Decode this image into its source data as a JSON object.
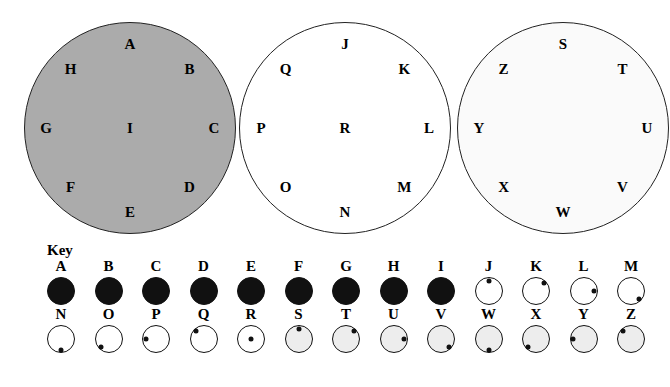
{
  "diagram": {
    "circles": [
      {
        "name": "circle-one",
        "fill": "#ababab",
        "stroke": "#222222",
        "center_label": "I",
        "ring_labels": [
          "A",
          "B",
          "C",
          "D",
          "E",
          "F",
          "G",
          "H"
        ]
      },
      {
        "name": "circle-two",
        "fill": "#ffffff",
        "stroke": "#222222",
        "center_label": "R",
        "ring_labels": [
          "J",
          "K",
          "L",
          "M",
          "N",
          "O",
          "P",
          "Q"
        ]
      },
      {
        "name": "circle-three",
        "fill": "#fafafa",
        "stroke": "#222222",
        "center_label": "",
        "ring_labels": [
          "S",
          "T",
          "U",
          "V",
          "W",
          "X",
          "Y",
          "Z"
        ]
      }
    ]
  },
  "key": {
    "title": "Key",
    "columns": [
      {
        "top": {
          "letter": "A",
          "fill": "dark",
          "dot": "none"
        },
        "bottom": {
          "letter": "N",
          "fill": "white",
          "dot": "bottom"
        }
      },
      {
        "top": {
          "letter": "B",
          "fill": "dark",
          "dot": "none"
        },
        "bottom": {
          "letter": "O",
          "fill": "white",
          "dot": "bottom-left"
        }
      },
      {
        "top": {
          "letter": "C",
          "fill": "dark",
          "dot": "none"
        },
        "bottom": {
          "letter": "P",
          "fill": "white",
          "dot": "left"
        }
      },
      {
        "top": {
          "letter": "D",
          "fill": "dark",
          "dot": "none"
        },
        "bottom": {
          "letter": "Q",
          "fill": "white",
          "dot": "top-left"
        }
      },
      {
        "top": {
          "letter": "E",
          "fill": "dark",
          "dot": "none"
        },
        "bottom": {
          "letter": "R",
          "fill": "white",
          "dot": "center"
        }
      },
      {
        "top": {
          "letter": "F",
          "fill": "dark",
          "dot": "none"
        },
        "bottom": {
          "letter": "S",
          "fill": "light",
          "dot": "top"
        }
      },
      {
        "top": {
          "letter": "G",
          "fill": "dark",
          "dot": "none"
        },
        "bottom": {
          "letter": "T",
          "fill": "light",
          "dot": "top-right"
        }
      },
      {
        "top": {
          "letter": "H",
          "fill": "dark",
          "dot": "none"
        },
        "bottom": {
          "letter": "U",
          "fill": "light",
          "dot": "right"
        }
      },
      {
        "top": {
          "letter": "I",
          "fill": "dark",
          "dot": "none"
        },
        "bottom": {
          "letter": "V",
          "fill": "light",
          "dot": "bottom-right"
        }
      },
      {
        "top": {
          "letter": "J",
          "fill": "white",
          "dot": "top"
        },
        "bottom": {
          "letter": "W",
          "fill": "light",
          "dot": "bottom"
        }
      },
      {
        "top": {
          "letter": "K",
          "fill": "white",
          "dot": "top-right"
        },
        "bottom": {
          "letter": "X",
          "fill": "light",
          "dot": "bottom-left"
        }
      },
      {
        "top": {
          "letter": "L",
          "fill": "white",
          "dot": "right"
        },
        "bottom": {
          "letter": "Y",
          "fill": "light",
          "dot": "left"
        }
      },
      {
        "top": {
          "letter": "M",
          "fill": "white",
          "dot": "bottom-right"
        },
        "bottom": {
          "letter": "Z",
          "fill": "light",
          "dot": "top-left"
        }
      }
    ]
  },
  "layout": {
    "circle_centers_x": [
      130,
      345,
      563
    ],
    "circle_center_y": 128,
    "circle_radius": 106,
    "key_col_start_x": 47,
    "key_col_step": 47.5
  }
}
